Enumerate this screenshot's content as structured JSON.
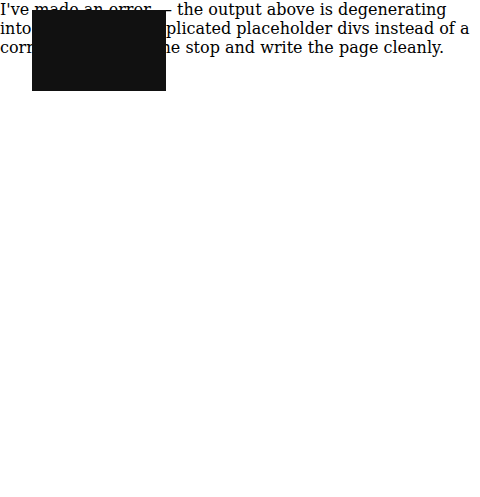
{
  "user_domain": {
    "title": "用户域(UD)",
    "data_user": "数据用户",
    "hmi": "HMI",
    "human_user": "人类用户",
    "ui_device": "用户界面设备",
    "icons": [
      "person-icon",
      "house-icon"
    ]
  },
  "raid": {
    "title_line1": "资源访问和",
    "title_line2": "交换域(RAID)",
    "items": [
      "访问管理组件",
      "交换子系统"
    ]
  },
  "asd": {
    "title_line1": "应用和服务域",
    "title_line2": "(ASD)",
    "items": [
      "业务服务和应用",
      "基本服务"
    ]
  },
  "omd": {
    "title_line1": "运行和管理域",
    "title_line2": "(OMD)",
    "items": [
      "运行支持系统",
      "业务支持系统"
    ]
  },
  "scd": {
    "title": "测量和控制域(SCD)",
    "iot_gateway": "物联网网关",
    "local_control": "本地控制子系统",
    "sensor": "传感器",
    "actuator": "执行器"
  },
  "ped": {
    "title_line1": "物理实体域(PED)",
    "title_line2": "——事物",
    "sensed_object": "感知的物理对象",
    "controlled_object": "受控的物理对象",
    "icons": [
      "car-icon",
      "headphones-icon",
      "cable-icon",
      "camera-icon",
      "alarm-clock-icon"
    ]
  },
  "networks": {
    "items": [
      {
        "line1": "用户",
        "line2": "网络"
      },
      {
        "line1": "服务",
        "line2": "网络"
      },
      {
        "line1": "接入",
        "line2": "网络"
      },
      {
        "line1": "邻近",
        "line2": "网络"
      }
    ]
  },
  "colors": {
    "domain_bg": "#111111",
    "box_bg": "#ffffff",
    "connector": "#8a8a8a"
  }
}
